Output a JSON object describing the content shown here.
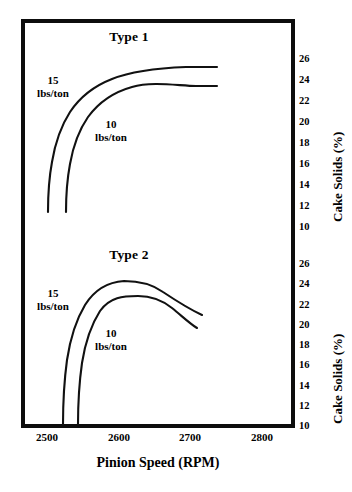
{
  "figure": {
    "xlabel": "Pinion Speed (RPM)",
    "panels": [
      {
        "title": "Type 1",
        "ylabel": "Cake Solids (%)",
        "series_labels": {
          "high": "15\nlbs/ton",
          "low": "10\nlbs/ton"
        }
      },
      {
        "title": "Type 2",
        "ylabel": "Cake Solids (%)",
        "series_labels": {
          "high": "15\nlbs/ton",
          "low": "10\nlbs/ton"
        }
      }
    ],
    "labels": {
      "type1_title": "Type 1",
      "type2_title": "Type 2",
      "type1_15": "15",
      "type1_15_unit": "lbs/ton",
      "type1_10": "10",
      "type1_10_unit": "lbs/ton",
      "type2_15": "15",
      "type2_15_unit": "lbs/ton",
      "type2_10": "10",
      "type2_10_unit": "lbs/ton",
      "ylabel_top": "Cake Solids (%)",
      "ylabel_bottom": "Cake Solids (%)",
      "xlabel": "Pinion Speed (RPM)"
    },
    "xticks": [
      "2500",
      "2600",
      "2700",
      "2800"
    ],
    "yticks_top": [
      "26",
      "24",
      "22",
      "20",
      "18",
      "16",
      "14",
      "12",
      "10"
    ],
    "yticks_bottom": [
      "26",
      "24",
      "22",
      "20",
      "18",
      "16",
      "14",
      "12",
      "10"
    ],
    "colors": {
      "curve": "#111111",
      "frame": "#0d0d0d",
      "background": "#ffffff"
    }
  },
  "chart_data": [
    {
      "type": "line",
      "title": "Type 1",
      "xlabel": "Pinion Speed (RPM)",
      "ylabel": "Cake Solids (%)",
      "xlim": [
        2460,
        2840
      ],
      "ylim": [
        9,
        27
      ],
      "xticks": [
        2500,
        2600,
        2700,
        2800
      ],
      "yticks": [
        10,
        12,
        14,
        16,
        18,
        20,
        22,
        24,
        26
      ],
      "grid": false,
      "legend": "inline-annotations",
      "series": [
        {
          "name": "15 lbs/ton",
          "x": [
            2503,
            2506,
            2512,
            2522,
            2535,
            2550,
            2568,
            2590,
            2615,
            2645,
            2680,
            2712,
            2735
          ],
          "y": [
            11.6,
            13.4,
            15.6,
            17.8,
            19.8,
            21.4,
            22.7,
            23.8,
            24.6,
            25.2,
            25.6,
            25.75,
            25.8
          ]
        },
        {
          "name": "10 lbs/ton",
          "x": [
            2528,
            2531,
            2537,
            2547,
            2560,
            2576,
            2595,
            2617,
            2642,
            2670,
            2700,
            2722,
            2735
          ],
          "y": [
            11.5,
            13.2,
            15.3,
            17.4,
            19.2,
            20.7,
            21.8,
            22.7,
            23.3,
            23.65,
            23.8,
            23.85,
            23.85
          ]
        }
      ]
    },
    {
      "type": "line",
      "title": "Type 2",
      "xlabel": "Pinion Speed (RPM)",
      "ylabel": "Cake Solids (%)",
      "xlim": [
        2460,
        2840
      ],
      "ylim": [
        9,
        27
      ],
      "xticks": [
        2500,
        2600,
        2700,
        2800
      ],
      "yticks": [
        10,
        12,
        14,
        16,
        18,
        20,
        22,
        24,
        26
      ],
      "grid": false,
      "legend": "inline-annotations",
      "series": [
        {
          "name": "15 lbs/ton",
          "x": [
            2525,
            2529,
            2536,
            2546,
            2558,
            2572,
            2590,
            2612,
            2635,
            2655,
            2675,
            2692,
            2705
          ],
          "y": [
            10.2,
            12.4,
            15.0,
            17.6,
            19.8,
            21.7,
            23.3,
            24.4,
            24.85,
            24.75,
            24.2,
            23.2,
            22.0
          ]
        },
        {
          "name": "10 lbs/ton",
          "x": [
            2545,
            2549,
            2556,
            2566,
            2578,
            2592,
            2610,
            2630,
            2650,
            2668,
            2684,
            2696,
            2698
          ],
          "y": [
            10.2,
            12.2,
            14.7,
            17.1,
            19.0,
            20.6,
            21.8,
            22.7,
            22.8,
            22.4,
            21.6,
            20.5,
            20.1
          ]
        }
      ]
    }
  ]
}
